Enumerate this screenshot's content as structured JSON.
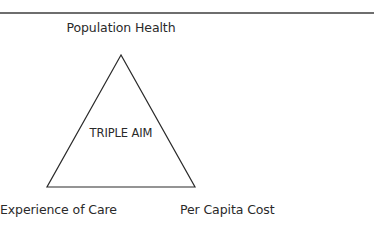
{
  "diagram": {
    "type": "triangle",
    "center_label": "TRIPLE AIM",
    "vertices": {
      "top": "Population Health",
      "bottom_left": "Experience of Care",
      "bottom_right": "Per Capita Cost"
    },
    "colors": {
      "line": "#2a2a2a",
      "rule": "#6e6e6e",
      "background": "#ffffff"
    }
  }
}
